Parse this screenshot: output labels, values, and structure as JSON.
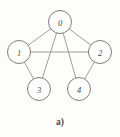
{
  "figure": {
    "caption": "a)",
    "background_color": "#fdfdfc",
    "edge_color": "#8d8d8d",
    "node_stroke_color": "#6f6f6f",
    "node_fill_color": "#fdfdfc",
    "label_color": "#4a4a4a"
  },
  "graph_data": {
    "type": "diagram",
    "diagram_kind": "undirected-graph",
    "node_radius": 11.5,
    "nodes": [
      {
        "id": "0",
        "label": "0",
        "x": 60,
        "y": 22
      },
      {
        "id": "1",
        "label": "1",
        "x": 19,
        "y": 52
      },
      {
        "id": "2",
        "label": "2",
        "x": 100,
        "y": 52
      },
      {
        "id": "3",
        "label": "3",
        "x": 39,
        "y": 89
      },
      {
        "id": "4",
        "label": "4",
        "x": 79,
        "y": 89
      }
    ],
    "edges": [
      {
        "id": "e-0-1",
        "from": "0",
        "to": "1"
      },
      {
        "id": "e-0-2",
        "from": "0",
        "to": "2"
      },
      {
        "id": "e-0-3",
        "from": "0",
        "to": "3"
      },
      {
        "id": "e-0-4",
        "from": "0",
        "to": "4"
      },
      {
        "id": "e-1-2",
        "from": "1",
        "to": "2"
      },
      {
        "id": "e-1-3",
        "from": "1",
        "to": "3"
      },
      {
        "id": "e-2-4",
        "from": "2",
        "to": "4"
      }
    ],
    "caption": "a)",
    "caption_x": 60,
    "caption_y": 122
  }
}
